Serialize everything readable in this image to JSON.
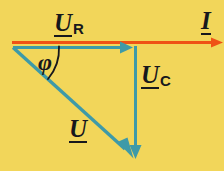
{
  "figure": {
    "type": "phasor-diagram",
    "background_color": "#f2d65a"
  },
  "colors": {
    "background": "#f2d65a",
    "current_phasor": "#ef5215",
    "voltage_phasor": "#3e9aa8",
    "text": "#17181c"
  },
  "labels": {
    "u_r": {
      "symbol": "U",
      "subscript": "R",
      "name": "resistor-voltage"
    },
    "i": {
      "symbol": "I",
      "subscript": "",
      "name": "current"
    },
    "u_c": {
      "symbol": "U",
      "subscript": "C",
      "name": "capacitor-voltage"
    },
    "u": {
      "symbol": "U",
      "subscript": "",
      "name": "total-voltage"
    },
    "phi": {
      "symbol": "φ",
      "name": "phase-angle"
    }
  },
  "vectors": [
    {
      "id": "i",
      "label": "I",
      "color": "#ef5215",
      "from": [
        12,
        42
      ],
      "to": [
        222,
        42
      ],
      "style": "arrow"
    },
    {
      "id": "u_r",
      "label": "U_R",
      "color": "#3e9aa8",
      "from": [
        13,
        47
      ],
      "to": [
        132,
        47
      ],
      "style": "arrow"
    },
    {
      "id": "u_c",
      "label": "U_C",
      "color": "#3e9aa8",
      "from": [
        135,
        47
      ],
      "to": [
        135,
        158
      ],
      "style": "arrow"
    },
    {
      "id": "u",
      "label": "U",
      "color": "#3e9aa8",
      "from": [
        13,
        47
      ],
      "to": [
        135,
        158
      ],
      "style": "arrow"
    }
  ],
  "arc": {
    "id": "phi-arc",
    "center": [
      13,
      47
    ],
    "radius": 46,
    "from_angle_deg": 0,
    "to_angle_deg": 42,
    "color": "#17181c"
  }
}
